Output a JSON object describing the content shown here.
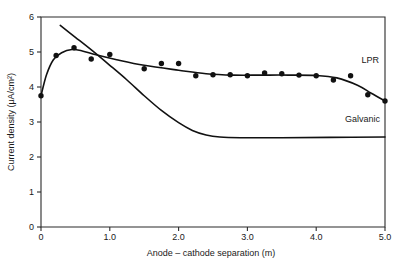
{
  "chart_data": {
    "type": "scatter",
    "title": "",
    "xlabel": "Anode – cathode separation (m)",
    "ylabel": "Current density (μA/cm²)",
    "xlim": [
      0,
      5.0
    ],
    "ylim": [
      0,
      6
    ],
    "xticks": [
      "0",
      "1.0",
      "2.0",
      "3.0",
      "4.0",
      "5.0"
    ],
    "xtick_values": [
      0,
      1.0,
      2.0,
      3.0,
      4.0,
      5.0
    ],
    "yticks": [
      "0",
      "1",
      "2",
      "3",
      "4",
      "5",
      "6"
    ],
    "ytick_values": [
      0,
      1,
      2,
      3,
      4,
      5,
      6
    ],
    "grid": false,
    "legend_position": "inline-annotation",
    "series": [
      {
        "name": "LPR",
        "label": "LPR",
        "marker": "filled-circle",
        "has_fit_line": true,
        "points": [
          {
            "x": 0.0,
            "y": 3.75
          },
          {
            "x": 0.22,
            "y": 4.9
          },
          {
            "x": 0.48,
            "y": 5.12
          },
          {
            "x": 0.73,
            "y": 4.8
          },
          {
            "x": 1.0,
            "y": 4.93
          },
          {
            "x": 1.5,
            "y": 4.52
          },
          {
            "x": 1.75,
            "y": 4.67
          },
          {
            "x": 2.0,
            "y": 4.67
          },
          {
            "x": 2.25,
            "y": 4.32
          },
          {
            "x": 2.5,
            "y": 4.35
          },
          {
            "x": 2.75,
            "y": 4.35
          },
          {
            "x": 3.0,
            "y": 4.32
          },
          {
            "x": 3.25,
            "y": 4.4
          },
          {
            "x": 3.5,
            "y": 4.38
          },
          {
            "x": 3.75,
            "y": 4.34
          },
          {
            "x": 4.0,
            "y": 4.32
          },
          {
            "x": 4.25,
            "y": 4.2
          },
          {
            "x": 4.5,
            "y": 4.32
          },
          {
            "x": 4.75,
            "y": 3.78
          },
          {
            "x": 5.0,
            "y": 3.6
          }
        ],
        "fit_curve": [
          {
            "x": 0.0,
            "y": 3.75
          },
          {
            "x": 0.08,
            "y": 4.35
          },
          {
            "x": 0.18,
            "y": 4.78
          },
          {
            "x": 0.3,
            "y": 4.98
          },
          {
            "x": 0.45,
            "y": 5.07
          },
          {
            "x": 0.6,
            "y": 5.03
          },
          {
            "x": 0.8,
            "y": 4.92
          },
          {
            "x": 1.1,
            "y": 4.78
          },
          {
            "x": 1.5,
            "y": 4.62
          },
          {
            "x": 2.0,
            "y": 4.48
          },
          {
            "x": 2.4,
            "y": 4.38
          },
          {
            "x": 2.8,
            "y": 4.34
          },
          {
            "x": 3.2,
            "y": 4.34
          },
          {
            "x": 3.6,
            "y": 4.34
          },
          {
            "x": 4.0,
            "y": 4.33
          },
          {
            "x": 4.3,
            "y": 4.26
          },
          {
            "x": 4.6,
            "y": 4.05
          },
          {
            "x": 4.8,
            "y": 3.82
          },
          {
            "x": 5.0,
            "y": 3.6
          }
        ]
      },
      {
        "name": "Galvanic",
        "label": "Galvanic",
        "marker": "none",
        "has_fit_line": true,
        "points": [],
        "fit_curve": [
          {
            "x": 0.28,
            "y": 5.76
          },
          {
            "x": 0.5,
            "y": 5.42
          },
          {
            "x": 0.75,
            "y": 5.03
          },
          {
            "x": 1.0,
            "y": 4.62
          },
          {
            "x": 1.25,
            "y": 4.2
          },
          {
            "x": 1.5,
            "y": 3.75
          },
          {
            "x": 1.75,
            "y": 3.33
          },
          {
            "x": 2.0,
            "y": 2.98
          },
          {
            "x": 2.2,
            "y": 2.76
          },
          {
            "x": 2.4,
            "y": 2.63
          },
          {
            "x": 2.6,
            "y": 2.57
          },
          {
            "x": 2.9,
            "y": 2.55
          },
          {
            "x": 3.5,
            "y": 2.55
          },
          {
            "x": 4.2,
            "y": 2.56
          },
          {
            "x": 5.0,
            "y": 2.57
          }
        ]
      }
    ],
    "annotations": [
      {
        "text": "LPR",
        "x": 4.66,
        "y": 4.7
      },
      {
        "text": "Galvanic",
        "x": 4.42,
        "y": 3.0
      }
    ]
  }
}
